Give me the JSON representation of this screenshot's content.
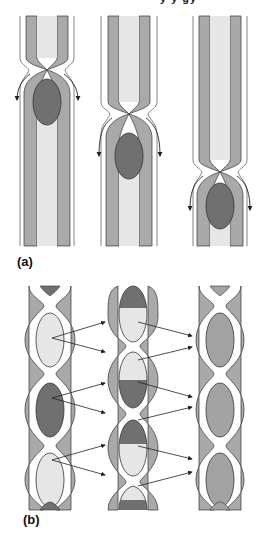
{
  "figure": {
    "header_fragment": "y       y   gy",
    "panels": [
      {
        "label": "(a)",
        "description": "Peristalsis: constriction wave moves bolus downward through tube",
        "stages": 3,
        "arrows": "down-curving arrows beside constriction"
      },
      {
        "label": "(b)",
        "description": "Segmentation: contents of segments split and mix into adjacent segments",
        "columns": 3
      }
    ],
    "colors": {
      "wall_outer": "#a9a9a9",
      "lumen": "#e6e6e6",
      "bolus_dark": "#707070",
      "mixed": "#a3a3a3",
      "outline": "#333333",
      "arrow": "#222222"
    }
  }
}
